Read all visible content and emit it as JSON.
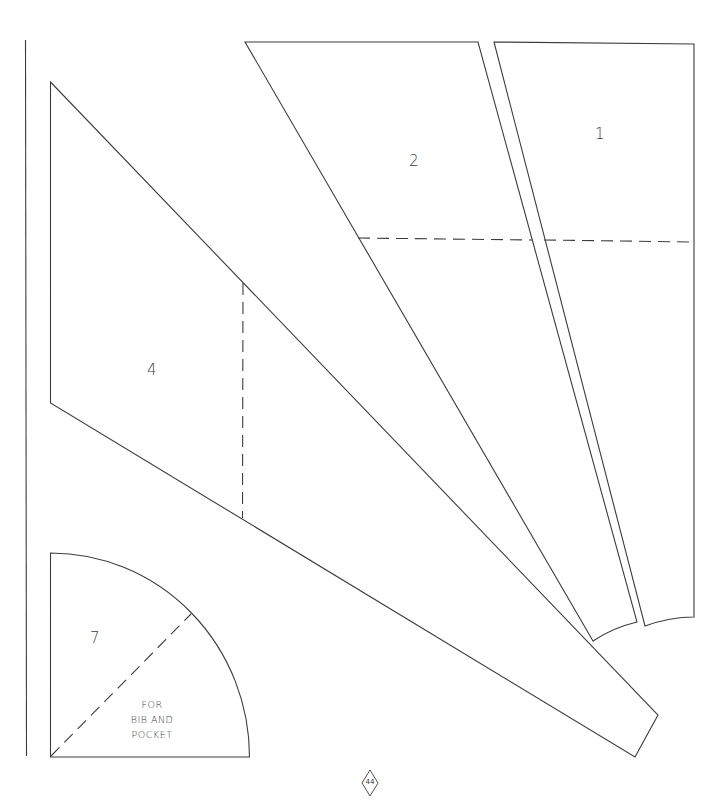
{
  "page": {
    "type": "sewing-pattern-sheet",
    "page_number": "44",
    "line_color": "#3c3c3c",
    "background": "#ffffff"
  },
  "pieces": [
    {
      "id": "1",
      "label": "1",
      "fold_line": "horizontal dashed"
    },
    {
      "id": "2",
      "label": "2",
      "fold_line": "horizontal dashed"
    },
    {
      "id": "4",
      "label": "4",
      "fold_line": "vertical dashed"
    },
    {
      "id": "7",
      "label": "7",
      "fold_line": "diagonal dashed",
      "note_lines": [
        "FOR",
        "BIB AND",
        "POCKET"
      ]
    }
  ]
}
